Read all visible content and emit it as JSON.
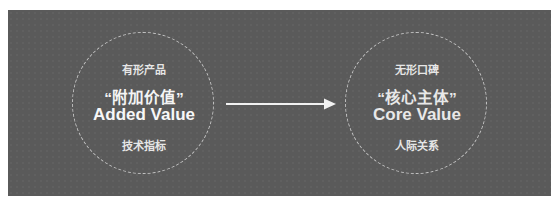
{
  "diagram": {
    "left": {
      "top_label": "有形产品",
      "cn_title": "“附加价值”",
      "en_title": "Added Value",
      "bottom_label": "技术指标"
    },
    "right": {
      "top_label": "无形口碑",
      "cn_title": "“核心主体”",
      "en_title": "Core Value",
      "bottom_label": "人际关系"
    },
    "arrow": {
      "direction": "left-to-right",
      "color": "#f2f2f2"
    },
    "colors": {
      "background": "#5a5a5a",
      "text": "#f2f2f2",
      "circle_border": "#e6e6e6"
    }
  }
}
